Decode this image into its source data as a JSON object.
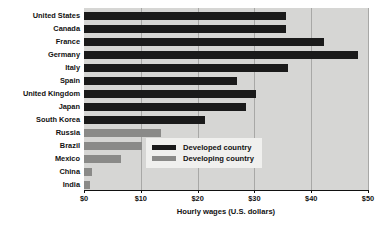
{
  "chart_data": {
    "type": "bar",
    "orientation": "horizontal",
    "title": "",
    "xlabel": "Hourly wages (U.S. dollars)",
    "ylabel": "",
    "xlim": [
      0,
      50
    ],
    "xticks": [
      0,
      10,
      20,
      30,
      40,
      50
    ],
    "xtick_labels": [
      "$0",
      "$10",
      "$20",
      "$30",
      "$40",
      "$50"
    ],
    "grid": true,
    "legend_position": "inside-right",
    "categories": [
      "United States",
      "Canada",
      "France",
      "Germany",
      "Italy",
      "Spain",
      "United Kingdom",
      "Japan",
      "South Korea",
      "Russia",
      "Brazil",
      "Mexico",
      "China",
      "India"
    ],
    "values": [
      35.5,
      35.5,
      42.2,
      48.2,
      36.0,
      27.0,
      30.3,
      28.5,
      21.3,
      13.5,
      10.2,
      6.6,
      1.4,
      1.0
    ],
    "groups": [
      "developed",
      "developed",
      "developed",
      "developed",
      "developed",
      "developed",
      "developed",
      "developed",
      "developed",
      "developing",
      "developing",
      "developing",
      "developing",
      "developing"
    ],
    "series": [
      {
        "name": "Developed country",
        "color": "#1a1a1a"
      },
      {
        "name": "Developing country",
        "color": "#8a8a88"
      }
    ],
    "legend": [
      {
        "label": "Developed country",
        "color": "#1a1a1a",
        "key": "developed"
      },
      {
        "label": "Developing country",
        "color": "#8a8a88",
        "key": "developing"
      }
    ],
    "plot_background": "#d6d6d4",
    "gridline_color": "#a8a8a6",
    "legend_background": "#f0f0ee"
  }
}
